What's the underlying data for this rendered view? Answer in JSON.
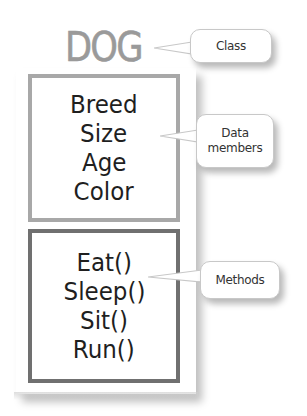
{
  "diagram": {
    "class_name": "DOG",
    "data_members": [
      "Breed",
      "Size",
      "Age",
      "Color"
    ],
    "methods": [
      "Eat()",
      "Sleep()",
      "Sit()",
      "Run()"
    ],
    "callouts": {
      "class": "Class",
      "data_members_line1": "Data",
      "data_members_line2": "members",
      "methods": "Methods"
    }
  },
  "colors": {
    "title": "#9a9a9a",
    "data_box_border": "#a8a8a8",
    "methods_box_border": "#707070",
    "text": "#1f1f1f",
    "callout_border": "#c8c8c8"
  }
}
